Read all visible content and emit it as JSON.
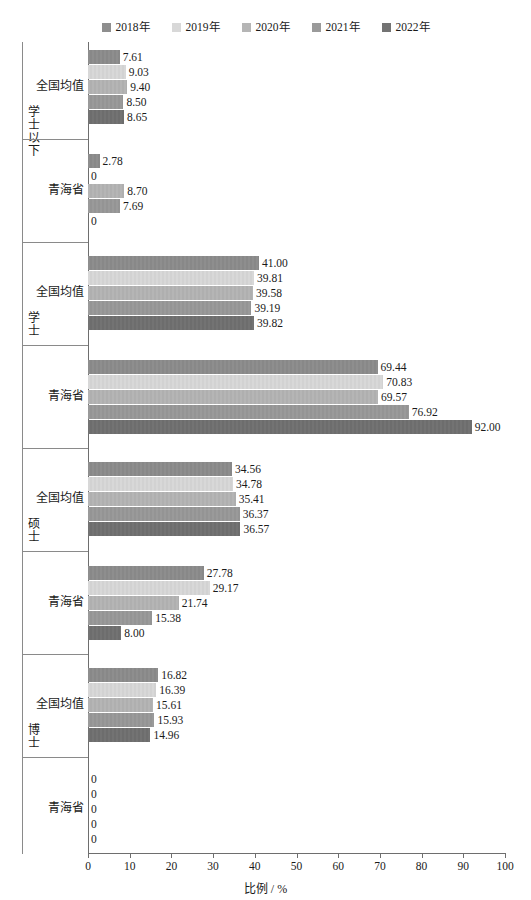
{
  "legend": {
    "items": [
      {
        "label": "2018年",
        "color": "#8e8e8e"
      },
      {
        "label": "2019年",
        "color": "#d8d8d8"
      },
      {
        "label": "2020年",
        "color": "#b5b5b5"
      },
      {
        "label": "2021年",
        "color": "#9a9a9a"
      },
      {
        "label": "2022年",
        "color": "#737373"
      }
    ]
  },
  "axis": {
    "x_title": "比例 / %",
    "x_ticks": [
      "0",
      "10",
      "20",
      "30",
      "40",
      "50",
      "60",
      "70",
      "80",
      "90",
      "100"
    ],
    "x_min": 0,
    "x_max": 100
  },
  "categories": {
    "national": "全国均值",
    "qinghai": "青海省"
  },
  "chart_data": {
    "type": "bar",
    "orientation": "horizontal",
    "title": "",
    "xlabel": "比例 / %",
    "ylabel": "",
    "xlim": [
      0,
      100
    ],
    "grid": false,
    "legend_position": "top-center",
    "series": [
      {
        "name": "2018年",
        "color": "#8e8e8e"
      },
      {
        "name": "2019年",
        "color": "#d8d8d8"
      },
      {
        "name": "2020年",
        "color": "#b5b5b5"
      },
      {
        "name": "2021年",
        "color": "#9a9a9a"
      },
      {
        "name": "2022年",
        "color": "#737373"
      }
    ],
    "groups": [
      {
        "group_label": "学士以下",
        "rows": [
          {
            "category": "全国均值",
            "values": [
              7.61,
              9.03,
              9.4,
              8.5,
              8.65
            ],
            "labels": [
              "7.61",
              "9.03",
              "9.40",
              "8.50",
              "8.65"
            ]
          },
          {
            "category": "青海省",
            "values": [
              2.78,
              0,
              8.7,
              7.69,
              0
            ],
            "labels": [
              "2.78",
              "0",
              "8.70",
              "7.69",
              "0"
            ]
          }
        ]
      },
      {
        "group_label": "学士",
        "rows": [
          {
            "category": "全国均值",
            "values": [
              41.0,
              39.81,
              39.58,
              39.19,
              39.82
            ],
            "labels": [
              "41.00",
              "39.81",
              "39.58",
              "39.19",
              "39.82"
            ]
          },
          {
            "category": "青海省",
            "values": [
              69.44,
              70.83,
              69.57,
              76.92,
              92.0
            ],
            "labels": [
              "69.44",
              "70.83",
              "69.57",
              "76.92",
              "92.00"
            ]
          }
        ]
      },
      {
        "group_label": "硕士",
        "rows": [
          {
            "category": "全国均值",
            "values": [
              34.56,
              34.78,
              35.41,
              36.37,
              36.57
            ],
            "labels": [
              "34.56",
              "34.78",
              "35.41",
              "36.37",
              "36.57"
            ]
          },
          {
            "category": "青海省",
            "values": [
              27.78,
              29.17,
              21.74,
              15.38,
              8.0
            ],
            "labels": [
              "27.78",
              "29.17",
              "21.74",
              "15.38",
              "8.00"
            ]
          }
        ]
      },
      {
        "group_label": "博士",
        "rows": [
          {
            "category": "全国均值",
            "values": [
              16.82,
              16.39,
              15.61,
              15.93,
              14.96
            ],
            "labels": [
              "16.82",
              "16.39",
              "15.61",
              "15.93",
              "14.96"
            ]
          },
          {
            "category": "青海省",
            "values": [
              0,
              0,
              0,
              0,
              0
            ],
            "labels": [
              "0",
              "0",
              "0",
              "0",
              "0"
            ]
          }
        ]
      }
    ]
  }
}
